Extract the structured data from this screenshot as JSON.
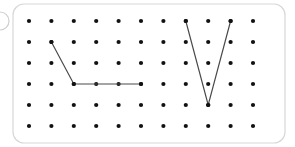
{
  "figure": {
    "title": "Geoboard with two line figures",
    "kind": "pegboard-diagram",
    "width": 295,
    "height": 147,
    "background_color": "#ffffff"
  },
  "panel": {
    "name": "geoboard-panel",
    "x": 13,
    "y": 4,
    "width": 272,
    "height": 139,
    "corner_radius": 11,
    "border_color": "#d7d7d7",
    "border_width": 1.2,
    "fill_color": "#ffffff"
  },
  "margin_artifact": {
    "name": "page-edge-arc",
    "cx": 0,
    "cy": 21,
    "r": 9,
    "stroke_color": "#cfcfcf",
    "stroke_width": 1.2
  },
  "grid": {
    "columns": 11,
    "rows": 6,
    "origin_x": 29,
    "origin_y": 21,
    "spacing_x": 22.4,
    "spacing_y": 21.0,
    "dot_radius": 2.1,
    "dot_color": "#111111",
    "column_x": [
      29,
      51.4,
      73.8,
      96.2,
      118.6,
      141,
      163.4,
      185.8,
      208.2,
      230.6,
      253
    ],
    "row_y": [
      21,
      42,
      63,
      84,
      105,
      126
    ]
  },
  "shapes": [
    {
      "name": "left-polyline",
      "label": "Left figure: diagonal then horizontal segment",
      "stroke_color": "#4a4a4a",
      "stroke_width": 1.2,
      "points_grid": [
        {
          "col": 1,
          "row": 1
        },
        {
          "col": 2,
          "row": 3
        },
        {
          "col": 5,
          "row": 3
        }
      ],
      "points_px": [
        {
          "x": 51.4,
          "y": 42
        },
        {
          "x": 73.8,
          "y": 84
        },
        {
          "x": 141,
          "y": 84
        }
      ]
    },
    {
      "name": "right-vee-polyline",
      "label": "Right figure: V shape",
      "stroke_color": "#4a4a4a",
      "stroke_width": 1.2,
      "points_grid": [
        {
          "col": 7,
          "row": 0
        },
        {
          "col": 8,
          "row": 4
        },
        {
          "col": 9,
          "row": 0
        }
      ],
      "points_px": [
        {
          "x": 185.8,
          "y": 21
        },
        {
          "x": 208.2,
          "y": 105
        },
        {
          "x": 230.6,
          "y": 21
        }
      ]
    }
  ]
}
